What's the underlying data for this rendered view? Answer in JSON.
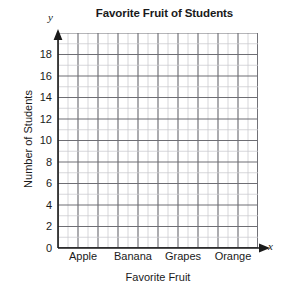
{
  "chart_data": {
    "type": "bar",
    "title": "Favorite Fruit of Students",
    "xlabel": "Favorite Fruit",
    "ylabel": "Number of Students",
    "x_axis_letter": "x",
    "y_axis_letter": "y",
    "categories": [
      "Apple",
      "Banana",
      "Grapes",
      "Orange"
    ],
    "values": [
      null,
      null,
      null,
      null
    ],
    "ylim": [
      0,
      20
    ],
    "ytick_labels": [
      "0",
      "2",
      "4",
      "6",
      "8",
      "10",
      "12",
      "14",
      "16",
      "18"
    ],
    "ytick_values": [
      0,
      2,
      4,
      6,
      8,
      10,
      12,
      14,
      16,
      18
    ],
    "y_minor_step": 1,
    "y_major_step": 2,
    "grid": true,
    "grid_columns": 20,
    "grid_rows": 20,
    "legend": null,
    "legend_position": "none",
    "annotations": [],
    "colors": {
      "grid_minor": "#c9c9cd",
      "grid_major": "#6e6e74",
      "axis": "#1a1a1a",
      "background": "#ffffff",
      "text": "#1a1a1a"
    }
  }
}
